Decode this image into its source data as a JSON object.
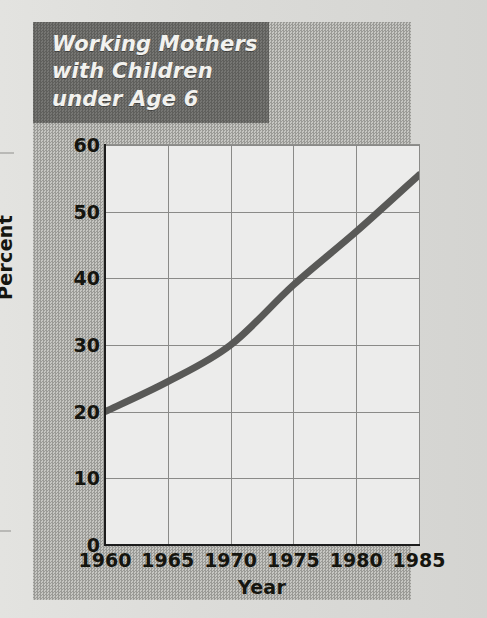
{
  "figure": {
    "title": "Working Mothers\nwith Children\nunder Age 6",
    "title_line_1": "Working Mothers",
    "title_line_2": "with Children",
    "title_line_3": "under Age 6",
    "panel_color": "#b2b2ae",
    "title_box_color": "#6b6b68",
    "title_text_color": "#f2f2ef",
    "plot_background": "#ececeb",
    "grid_color": "#8a8a88",
    "axis_color": "#1c1c1c",
    "series_color": "#595957"
  },
  "chart_data": {
    "type": "line",
    "title": "Working Mothers with Children under Age 6",
    "xlabel": "Year",
    "ylabel": "Percent",
    "x": [
      1960,
      1965,
      1970,
      1975,
      1980,
      1985
    ],
    "values": [
      20,
      24.5,
      30,
      39,
      47,
      55.5
    ],
    "series": [
      {
        "name": "Working Mothers with Children under Age 6",
        "values": [
          20,
          24.5,
          30,
          39,
          47,
          55.5
        ]
      }
    ],
    "xlim": [
      1960,
      1985
    ],
    "ylim": [
      0,
      60
    ],
    "xticks": [
      "1960",
      "1965",
      "1970",
      "1975",
      "1980",
      "1985"
    ],
    "yticks": [
      "0",
      "10",
      "20",
      "30",
      "40",
      "50",
      "60"
    ],
    "ytick_values": [
      0,
      10,
      20,
      30,
      40,
      50,
      60
    ],
    "xtick_values": [
      1960,
      1965,
      1970,
      1975,
      1980,
      1985
    ],
    "grid": true,
    "legend": false,
    "legend_position": "none",
    "annotations": []
  }
}
